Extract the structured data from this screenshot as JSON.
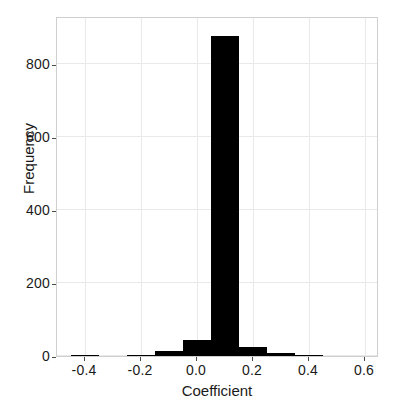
{
  "chart_data": {
    "type": "bar",
    "title": "",
    "subtitle": "",
    "xlabel": "Coefficient",
    "ylabel": "Frequency",
    "xlim": [
      -0.5,
      0.65
    ],
    "ylim": [
      0,
      930
    ],
    "grid": true,
    "legend": null,
    "bin_width": 0.1,
    "bar_color": "#000000",
    "grid_color": "#e9e9e9",
    "axes_color": "#cfcfcf",
    "xticks": [
      -0.4,
      -0.2,
      0.0,
      0.2,
      0.4,
      0.6
    ],
    "xtick_labels": [
      "-0.4",
      "-0.2",
      "0.0",
      "0.2",
      "0.4",
      "0.6"
    ],
    "yticks": [
      0,
      200,
      400,
      600,
      800
    ],
    "ytick_labels": [
      "0",
      "200",
      "400",
      "600",
      "800"
    ],
    "bins": [
      {
        "left": -0.45,
        "right": -0.35,
        "center": -0.4,
        "value": 3
      },
      {
        "left": -0.35,
        "right": -0.25,
        "center": -0.3,
        "value": 0
      },
      {
        "left": -0.25,
        "right": -0.15,
        "center": -0.2,
        "value": 1
      },
      {
        "left": -0.15,
        "right": -0.05,
        "center": -0.1,
        "value": 15
      },
      {
        "left": -0.05,
        "right": 0.05,
        "center": 0.0,
        "value": 43
      },
      {
        "left": 0.05,
        "right": 0.15,
        "center": 0.1,
        "value": 875
      },
      {
        "left": 0.15,
        "right": 0.25,
        "center": 0.2,
        "value": 26
      },
      {
        "left": 0.25,
        "right": 0.35,
        "center": 0.3,
        "value": 7
      },
      {
        "left": 0.35,
        "right": 0.45,
        "center": 0.4,
        "value": 1
      }
    ]
  }
}
